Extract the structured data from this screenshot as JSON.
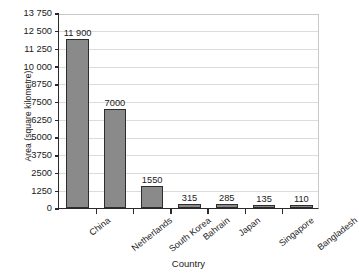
{
  "chart_data": {
    "type": "bar",
    "title": "",
    "xlabel": "Country",
    "ylabel": "Area (square kilometre)",
    "categories": [
      "China",
      "Netherlands",
      "South Korea",
      "Bahrain",
      "Japan",
      "Singapore",
      "Bangladesh"
    ],
    "values": [
      11900,
      7000,
      1550,
      315,
      285,
      135,
      110
    ],
    "value_labels": [
      "11 900",
      "7000",
      "1550",
      "315",
      "285",
      "135",
      "110"
    ],
    "ylim": [
      0,
      13750
    ],
    "ytick_values": [
      0,
      1250,
      2500,
      3750,
      5000,
      6250,
      7500,
      8750,
      10000,
      11250,
      12500,
      13750
    ],
    "ytick_labels": [
      "0",
      "1250",
      "2500",
      "3750",
      "5000",
      "6250",
      "7500",
      "8750",
      "10 000",
      "11 250",
      "12 500",
      "13 750"
    ],
    "grid": true,
    "legend": "none",
    "bar_color": "#8a8a8a",
    "bar_edge_color": "#2d2d2d",
    "grid_color": "#dcdcdc",
    "axis_color": "#2a2a2a",
    "background_color": "#ffffff"
  }
}
